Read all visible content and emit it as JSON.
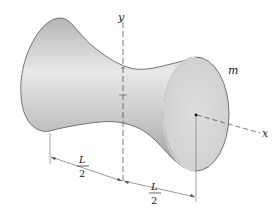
{
  "figure": {
    "labels": {
      "y_axis": "y",
      "x_axis": "x",
      "mass": "m",
      "half_length_left_num": "L",
      "half_length_left_den": "2",
      "half_length_right_num": "L",
      "half_length_right_den": "2"
    },
    "colors": {
      "body_light": "#e6e6e6",
      "body_dark": "#a9a9a9",
      "end_face": "#d9d9d9",
      "outline": "#555555",
      "axis": "#444444"
    }
  }
}
